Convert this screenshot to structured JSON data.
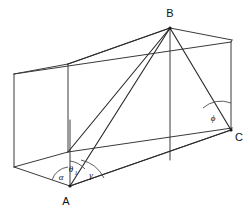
{
  "figure": {
    "type": "geometry-diagram",
    "shape": "rectangular-box",
    "background_color": "#ffffff",
    "line_color": "#3a3a3a",
    "width": 249,
    "height": 213
  },
  "vertices": {
    "a": {
      "label": "A",
      "x": 70,
      "y": 186,
      "label_x": 66,
      "label_y": 203
    },
    "b": {
      "label": "B",
      "x": 170,
      "y": 28,
      "label_x": 166,
      "label_y": 19
    },
    "c": {
      "label": "C",
      "x": 231,
      "y": 130,
      "label_x": 236,
      "label_y": 140
    }
  },
  "angles": [
    {
      "name": "alpha",
      "label": "α",
      "sub": "",
      "x": 61,
      "y": 180
    },
    {
      "name": "theta-1",
      "label": "θ",
      "sub": "1",
      "x": 71,
      "y": 168
    },
    {
      "name": "gamma",
      "label": "γ",
      "sub": "",
      "x": 90,
      "y": 176
    },
    {
      "name": "phi",
      "label": "ϕ",
      "sub": "",
      "x": 210,
      "y": 118
    }
  ],
  "box": {
    "front_bottom_left": {
      "x": 14,
      "y": 167
    },
    "front_bottom_right": {
      "x": 231,
      "y": 130
    },
    "front_top_left": {
      "x": 14,
      "y": 74
    },
    "front_top_right": {
      "x": 231,
      "y": 42
    },
    "back_bottom_left": {
      "x": 68,
      "y": 152
    },
    "back_bottom_right": {
      "x": 232,
      "y": 128
    },
    "back_top_left": {
      "x": 68,
      "y": 64
    },
    "back_top_right": {
      "x": 170,
      "y": 28
    },
    "vertex_a": {
      "x": 70,
      "y": 186
    },
    "vertex_c": {
      "x": 231,
      "y": 130
    }
  },
  "segments": [
    {
      "name": "segment-ab",
      "from": "A",
      "to": "B"
    },
    {
      "name": "segment-ac",
      "from": "A",
      "to": "C"
    },
    {
      "name": "segment-bc",
      "from": "B",
      "to": "C"
    },
    {
      "name": "segment-a-vertical",
      "from": "A",
      "to": "top-above-a"
    }
  ]
}
